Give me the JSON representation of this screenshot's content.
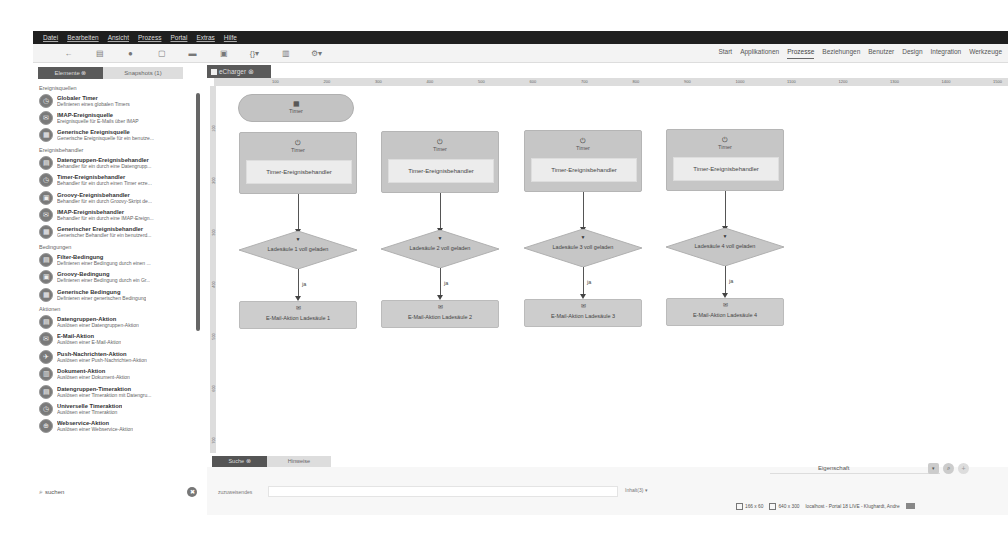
{
  "menubar": [
    "Datei",
    "Bearbeiten",
    "Ansicht",
    "Prozess",
    "Portal",
    "Extras",
    "Hilfe"
  ],
  "toolbar": {
    "icons": [
      {
        "name": "back-icon",
        "glyph": "←"
      },
      {
        "name": "export-icon",
        "glyph": "▤"
      },
      {
        "name": "globe-icon",
        "glyph": "●"
      },
      {
        "name": "new-file-icon",
        "glyph": "▢"
      },
      {
        "name": "folder-icon",
        "glyph": "▬"
      },
      {
        "name": "save-icon",
        "glyph": "▣"
      },
      {
        "name": "braces-dropdown-icon",
        "glyph": "{}▾"
      },
      {
        "name": "trash-icon",
        "glyph": "▥"
      },
      {
        "name": "settings-dropdown-icon",
        "glyph": "⚙▾"
      }
    ]
  },
  "topnav": {
    "items": [
      "Start",
      "Applikationen",
      "Prozesse",
      "Beziehungen",
      "Benutzer",
      "Design",
      "Integration",
      "Werkzeuge"
    ],
    "active": "Prozesse"
  },
  "left_tabs": [
    {
      "label": "Elemente ⊗",
      "active": true
    },
    {
      "label": "Snapshots (1)",
      "active": false
    }
  ],
  "palette": [
    {
      "category": "Ereignisquellen",
      "items": [
        {
          "title": "Globaler Timer",
          "desc": "Definieren eines globalen Timers",
          "icon": "timer-icon"
        },
        {
          "title": "IMAP-Ereignisquelle",
          "desc": "Ereignisquelle für E-Mails über IMAP",
          "icon": "mail-source-icon"
        },
        {
          "title": "Generische Ereignisquelle",
          "desc": "Generische Ereignisquelle für ein benutze...",
          "icon": "generic-source-icon"
        }
      ]
    },
    {
      "category": "Ereignisbehandler",
      "items": [
        {
          "title": "Datengruppen-Ereignisbehandler",
          "desc": "Behandler für ein durch eine Datengrupp...",
          "icon": "datagroup-handler-icon"
        },
        {
          "title": "Timer-Ereignisbehandler",
          "desc": "Behandler für ein durch einen Timer erze...",
          "icon": "timer-handler-icon"
        },
        {
          "title": "Groovy-Ereignisbehandler",
          "desc": "Behandler für ein durch Groovy-Skript de...",
          "icon": "groovy-handler-icon"
        },
        {
          "title": "IMAP-Ereignisbehandler",
          "desc": "Behandler für ein durch eine IMAP-Ereign...",
          "icon": "imap-handler-icon"
        },
        {
          "title": "Generischer Ereignisbehandler",
          "desc": "Generischer Behandler für ein benutzerd...",
          "icon": "generic-handler-icon"
        }
      ]
    },
    {
      "category": "Bedingungen",
      "items": [
        {
          "title": "Filter-Bedingung",
          "desc": "Definieren einer Bedingung durch einen ...",
          "icon": "filter-condition-icon"
        },
        {
          "title": "Groovy-Bedingung",
          "desc": "Definieren einer Bedingung durch ein Gr...",
          "icon": "groovy-condition-icon"
        },
        {
          "title": "Generische Bedingung",
          "desc": "Definieren einer generischen Bedingung",
          "icon": "generic-condition-icon"
        }
      ]
    },
    {
      "category": "Aktionen",
      "items": [
        {
          "title": "Datengruppen-Aktion",
          "desc": "Auslösen einer Datengruppen-Aktion",
          "icon": "datagroup-action-icon"
        },
        {
          "title": "E-Mail-Aktion",
          "desc": "Auslösen einer E-Mail-Aktion",
          "icon": "email-action-icon"
        },
        {
          "title": "Push-Nachrichten-Aktion",
          "desc": "Auslösen einer Push-Nachrichten-Aktion",
          "icon": "push-action-icon"
        },
        {
          "title": "Dokument-Aktion",
          "desc": "Auslösen einer Dokument-Aktion",
          "icon": "document-action-icon"
        },
        {
          "title": "Datengruppen-Timeraktion",
          "desc": "Auslösen einer Timeraktion mit Datengru...",
          "icon": "datagroup-timer-icon"
        },
        {
          "title": "Universelle Timeraktion",
          "desc": "Auslösen einer Timeraktion",
          "icon": "universal-timer-icon"
        },
        {
          "title": "Webservice-Aktion",
          "desc": "Auslösen einer Webservice-Aktion",
          "icon": "webservice-action-icon"
        }
      ]
    }
  ],
  "search": {
    "placeholder": "suchen",
    "icon": "search-icon"
  },
  "editor": {
    "tab": "eCharger ⊗",
    "ruler_h": [
      "100",
      "200",
      "300",
      "400",
      "500",
      "600",
      "700",
      "800",
      "900",
      "1000",
      "1100",
      "1200",
      "1300",
      "1400",
      "1500"
    ],
    "ruler_v": [
      "100",
      "200",
      "300",
      "400",
      "500",
      "600",
      "700"
    ],
    "start_node": {
      "label": "Timer",
      "icon": "timer-source-icon"
    },
    "lanes": [
      {
        "handler_label": "Timer",
        "handler_inner": "Timer-Ereignisbehandler",
        "condition": "Ladesäule 1 voll geladen",
        "edge": "ja",
        "action": "E-Mail-Aktion Ladesäule 1"
      },
      {
        "handler_label": "Timer",
        "handler_inner": "Timer-Ereignisbehandler",
        "condition": "Ladesäule 2 voll geladen",
        "edge": "ja",
        "action": "E-Mail-Aktion Ladesäule 2"
      },
      {
        "handler_label": "Timer",
        "handler_inner": "Timer-Ereignisbehandler",
        "condition": "Ladesäule 3 voll geladen",
        "edge": "ja",
        "action": "E-Mail-Aktion Ladesäule 3"
      },
      {
        "handler_label": "Timer",
        "handler_inner": "Timer-Ereignisbehandler",
        "condition": "Ladesäule 4 voll geladen",
        "edge": "ja",
        "action": "E-Mail-Aktion Ladesäule 4"
      }
    ]
  },
  "bottom": {
    "tabs": [
      {
        "label": "Suche ⊗",
        "active": true
      },
      {
        "label": "Hinweise",
        "active": false
      }
    ],
    "property_label": "Eigenschaft",
    "substitute_label": "zuzuweisendes",
    "link_select": "Inhalt(3) ▾"
  },
  "statusbar": {
    "selection_size": "166 x 60",
    "canvas_size": "640 x 300",
    "connection": "localhost - Portal 18 LIVE - Klughardt, Andre"
  }
}
